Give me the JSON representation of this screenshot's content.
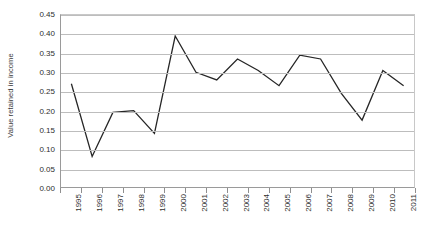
{
  "chart_data": {
    "type": "line",
    "title": "",
    "xlabel": "",
    "ylabel": "Value retained in income",
    "categories": [
      "1995",
      "1996",
      "1997",
      "1998",
      "1999",
      "2000",
      "2001",
      "2002",
      "2003",
      "2004",
      "2005",
      "2006",
      "2007",
      "2008",
      "2009",
      "2010",
      "2011"
    ],
    "values": [
      0.27,
      0.08,
      0.195,
      0.2,
      0.14,
      0.395,
      0.3,
      0.28,
      0.335,
      0.305,
      0.265,
      0.345,
      0.335,
      0.245,
      0.175,
      0.305,
      0.265
    ],
    "series": [
      {
        "name": "Value retained in income",
        "values": [
          0.27,
          0.08,
          0.195,
          0.2,
          0.14,
          0.395,
          0.3,
          0.28,
          0.335,
          0.305,
          0.265,
          0.345,
          0.335,
          0.245,
          0.175,
          0.305,
          0.265
        ],
        "color": "#262626"
      }
    ],
    "ylim": [
      0.0,
      0.45
    ],
    "ytick_labels": [
      "0.00",
      "0.05",
      "0.10",
      "0.15",
      "0.20",
      "0.25",
      "0.30",
      "0.35",
      "0.40",
      "0.45"
    ],
    "ytick_values": [
      0.0,
      0.05,
      0.1,
      0.15,
      0.2,
      0.25,
      0.3,
      0.35,
      0.4,
      0.45
    ],
    "grid": "horizontal",
    "legend": "none",
    "markers": "none",
    "line_color": "#262626",
    "gridline_color": "#bdbdbd",
    "axis_color": "#9a9a9a",
    "plot_background": "#ffffff"
  },
  "caption": {
    "text": ""
  }
}
